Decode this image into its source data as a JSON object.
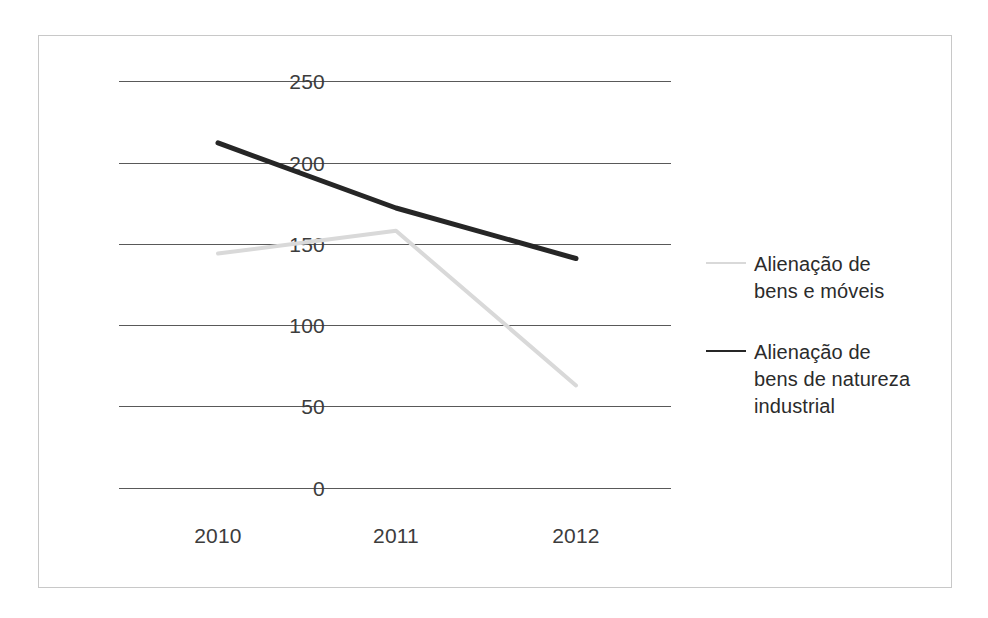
{
  "chart_data": {
    "type": "line",
    "title": "",
    "xlabel": "",
    "ylabel": "",
    "categories": [
      "2010",
      "2011",
      "2012"
    ],
    "x_tick_labels": [
      "2010",
      "2011",
      "2012"
    ],
    "y_tick_labels": [
      "250",
      "200",
      "150",
      "100",
      "50",
      "0"
    ],
    "y_ticks": [
      250,
      200,
      150,
      100,
      50,
      0
    ],
    "ylim": [
      0,
      250
    ],
    "grid": "horizontal",
    "legend_position": "right",
    "series": [
      {
        "name": "Alienação de bens e móveis",
        "name_lines": "Alienação de\nbens e móveis",
        "color": "#d9d9d9",
        "values": [
          144,
          158,
          63
        ]
      },
      {
        "name": "Alienação de bens de natureza industrial",
        "name_lines": "Alienação de\nbens de natureza\nindustrial",
        "color": "#262626",
        "values": [
          212,
          172,
          141
        ]
      }
    ]
  },
  "axis": {
    "y_labels": [
      "250",
      "200",
      "150",
      "100",
      "50",
      "0"
    ],
    "x_labels": [
      "2010",
      "2011",
      "2012"
    ]
  },
  "legend": {
    "items": [
      {
        "label": "Alienação de\nbens e móveis",
        "swatch": "light-line-swatch"
      },
      {
        "label": "Alienação de\nbens de natureza\nindustrial",
        "swatch": "dark-line-swatch"
      }
    ]
  },
  "colors": {
    "series_light": "#d9d9d9",
    "series_dark": "#262626",
    "gridline": "#595959",
    "frame_border": "#c8c8c8",
    "tick_text": "#3c3c3c",
    "legend_text": "#2b2b2b"
  }
}
